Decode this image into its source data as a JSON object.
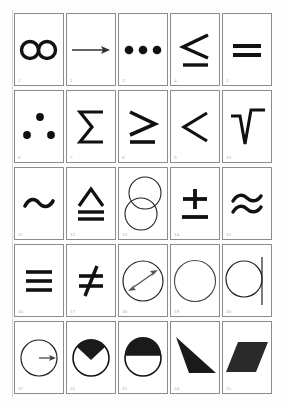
{
  "sheet": {
    "title": "Mathematical symbol and shape card grid",
    "rows": 5,
    "columns": 5,
    "total_cards": 25,
    "background_color": "#fdfdfd",
    "card_border_color": "#8c8c8c",
    "ink_color": "#111111",
    "label_color": "#a8a8a8"
  },
  "cards": [
    {
      "number": "1",
      "symbol": "∞",
      "name": "infinity",
      "icon": "infinity-icon"
    },
    {
      "number": "2",
      "symbol": "→",
      "name": "rightwards arrow",
      "icon": "arrow-right-icon"
    },
    {
      "number": "3",
      "symbol": "⋯",
      "name": "three dots in a row",
      "icon": "three-dots-row-icon"
    },
    {
      "number": "4",
      "symbol": "≤",
      "name": "less than or equal to",
      "icon": "less-than-or-equal-icon"
    },
    {
      "number": "5",
      "symbol": "=",
      "name": "equals",
      "icon": "equals-icon"
    },
    {
      "number": "6",
      "symbol": "∴",
      "name": "therefore three dots",
      "icon": "therefore-icon"
    },
    {
      "number": "7",
      "symbol": "Σ",
      "name": "sigma summation",
      "icon": "sigma-icon"
    },
    {
      "number": "8",
      "symbol": "≥",
      "name": "greater than or equal",
      "icon": "greater-than-or-equal-icon"
    },
    {
      "number": "9",
      "symbol": "<",
      "name": "less than",
      "icon": "less-than-icon"
    },
    {
      "number": "10",
      "symbol": "√",
      "name": "square root radical",
      "icon": "radical-icon"
    },
    {
      "number": "11",
      "symbol": "~",
      "name": "tilde",
      "icon": "tilde-icon"
    },
    {
      "number": "12",
      "symbol": "≜",
      "name": "delta equal to",
      "icon": "delta-equal-icon"
    },
    {
      "number": "13",
      "symbol": "",
      "name": "two overlapping circles",
      "icon": "two-circles-icon"
    },
    {
      "number": "14",
      "symbol": "±",
      "name": "plus minus",
      "icon": "plus-minus-icon"
    },
    {
      "number": "15",
      "symbol": "≈",
      "name": "approximately equal",
      "icon": "approximately-equal-icon"
    },
    {
      "number": "16",
      "symbol": "≡",
      "name": "identical to triple bar",
      "icon": "identical-to-icon"
    },
    {
      "number": "17",
      "symbol": "≠",
      "name": "not equal to",
      "icon": "not-equal-icon"
    },
    {
      "number": "18",
      "symbol": "",
      "name": "circle with diameter arrow",
      "icon": "circle-diameter-arrow-icon"
    },
    {
      "number": "19",
      "symbol": "○",
      "name": "circle outline",
      "icon": "circle-outline-icon"
    },
    {
      "number": "20",
      "symbol": "",
      "name": "circle tangent to line",
      "icon": "circle-tangent-line-icon"
    },
    {
      "number": "21",
      "symbol": "",
      "name": "circle with radius arrow",
      "icon": "circle-radius-arrow-icon"
    },
    {
      "number": "22",
      "symbol": "",
      "name": "circle with filled wedge",
      "icon": "circle-wedge-icon"
    },
    {
      "number": "23",
      "symbol": "",
      "name": "circle with filled upper half",
      "icon": "circle-half-filled-icon"
    },
    {
      "number": "24",
      "symbol": "◢",
      "name": "filled triangle",
      "icon": "filled-triangle-icon"
    },
    {
      "number": "25",
      "symbol": "",
      "name": "filled parallelogram",
      "icon": "filled-parallelogram-icon"
    }
  ]
}
